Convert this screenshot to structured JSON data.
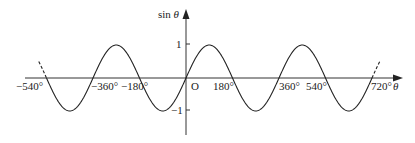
{
  "chart_data": {
    "type": "line",
    "title": "",
    "xlabel": "θ",
    "ylabel": "sin θ",
    "origin_label": "O",
    "x_tick_labels": [
      "−540°",
      "−360°",
      "−180°",
      "180°",
      "360°",
      "540°",
      "720°"
    ],
    "x_tick_values": [
      -540,
      -360,
      -180,
      180,
      360,
      540,
      720
    ],
    "y_tick_labels": [
      "1",
      "−1"
    ],
    "y_tick_values": [
      1,
      -1
    ],
    "xlim": [
      -600,
      780
    ],
    "ylim": [
      -1.6,
      1.6
    ],
    "grid": false,
    "legend": null,
    "series": [
      {
        "name": "sin θ",
        "function": "sin",
        "solid_range": [
          -540,
          720
        ],
        "dashed_extensions": [
          [
            -570,
            -540
          ],
          [
            720,
            750
          ]
        ],
        "x": [
          -540,
          -450,
          -360,
          -270,
          -180,
          -90,
          0,
          90,
          180,
          270,
          360,
          450,
          540,
          630,
          720
        ],
        "y": [
          0,
          -1,
          0,
          1,
          0,
          -1,
          0,
          1,
          0,
          -1,
          0,
          1,
          0,
          -1,
          0
        ]
      }
    ]
  }
}
